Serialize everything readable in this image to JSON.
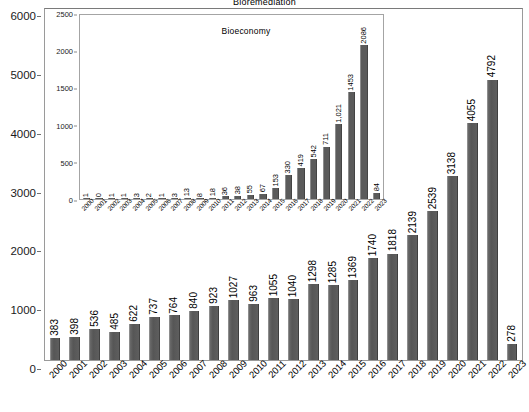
{
  "chart_data": {
    "type": "bar",
    "title": "Bioremediation",
    "xlabel": "",
    "ylabel": "",
    "ylim": [
      0,
      6000
    ],
    "yticks": [
      0,
      1000,
      2000,
      3000,
      4000,
      5000,
      6000
    ],
    "grid": false,
    "legend": "none",
    "bar_color": "#5b5b5b",
    "categories": [
      "2000",
      "2001",
      "2002",
      "2003",
      "2004",
      "2005",
      "2006",
      "2007",
      "2008",
      "2009",
      "2010",
      "2011",
      "2012",
      "2013",
      "2014",
      "2015",
      "2016",
      "2017",
      "2018",
      "2019",
      "2020",
      "2021",
      "2022",
      "2023"
    ],
    "values": [
      383,
      398,
      536,
      485,
      622,
      737,
      764,
      840,
      923,
      1027,
      963,
      1055,
      1040,
      1298,
      1285,
      1369,
      1740,
      1818,
      2139,
      2539,
      3138,
      4055,
      4792,
      278
    ],
    "labels": [
      "383",
      "398",
      "536",
      "485",
      "622",
      "737",
      "764",
      "840",
      "923",
      "1027",
      "963",
      "1055",
      "1040",
      "1298",
      "1285",
      "1369",
      "1740",
      "1818",
      "2139",
      "2539",
      "3138",
      "4055",
      "4792",
      "278"
    ],
    "inset": {
      "type": "bar",
      "title": "Bioeconomy",
      "ylim": [
        0,
        2500
      ],
      "yticks": [
        0,
        500,
        1000,
        1500,
        2000,
        2500
      ],
      "grid": false,
      "bar_color": "#5b5b5b",
      "categories": [
        "2000",
        "2001",
        "2002",
        "2003",
        "2004",
        "2005",
        "2006",
        "2007",
        "2008",
        "2009",
        "2010",
        "2011",
        "2012",
        "2013",
        "2014",
        "2015",
        "2016",
        "2017",
        "2018",
        "2019",
        "2020",
        "2021",
        "2022",
        "2023"
      ],
      "values": [
        1,
        0,
        1,
        1,
        3,
        2,
        1,
        3,
        13,
        8,
        18,
        36,
        38,
        55,
        67,
        153,
        330,
        419,
        542,
        711,
        1021,
        1453,
        2086,
        84
      ],
      "labels": [
        "1",
        "0",
        "1",
        "1",
        "3",
        "2",
        "1",
        "3",
        "13",
        "8",
        "18",
        "36",
        "38",
        "55",
        "67",
        "153",
        "330",
        "419",
        "542",
        "711",
        "1,021",
        "1453",
        "2086",
        "84"
      ]
    }
  }
}
